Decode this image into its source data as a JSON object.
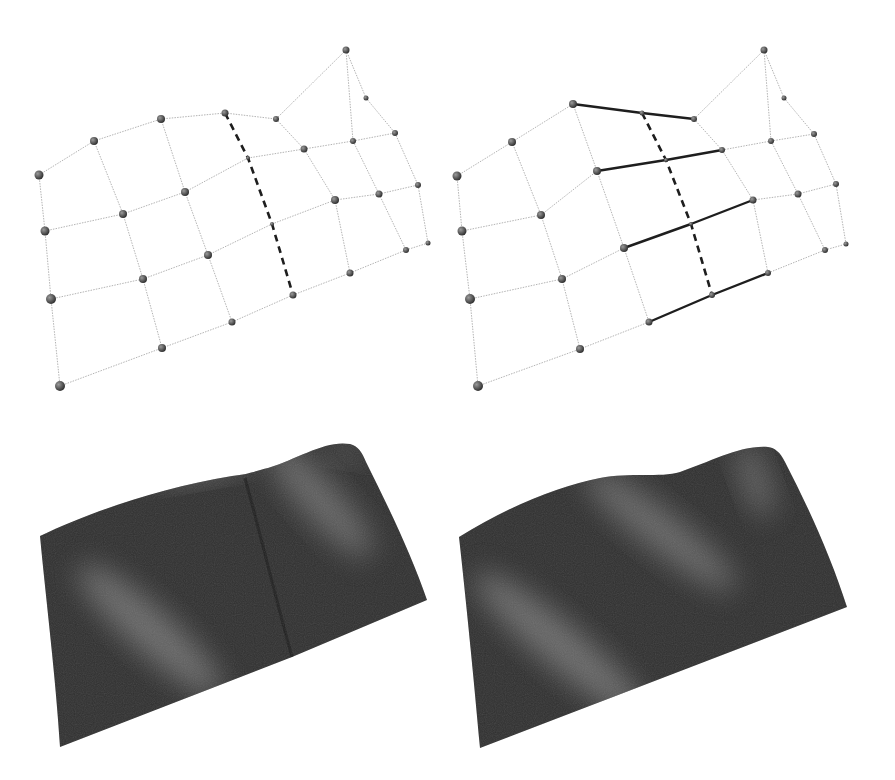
{
  "figure": {
    "colors": {
      "background": "#ffffff",
      "mesh_edge": "#b4b4b4",
      "highlight_edge": "#1e1e1e",
      "vertex": "#4a4a4a",
      "surface_dark": "#2e2e2e",
      "surface_light": "#9a9a9a"
    },
    "panels": [
      {
        "id": "control-mesh-left",
        "kind": "control-mesh",
        "vertices": [
          [
            39,
            175
          ],
          [
            94,
            141
          ],
          [
            161,
            119
          ],
          [
            225,
            113
          ],
          [
            276,
            119
          ],
          [
            346,
            50
          ],
          [
            366,
            98
          ],
          [
            395,
            133
          ],
          [
            248,
            158
          ],
          [
            304,
            149
          ],
          [
            353,
            141
          ],
          [
            45,
            231
          ],
          [
            123,
            214
          ],
          [
            185,
            192
          ],
          [
            272,
            224
          ],
          [
            335,
            200
          ],
          [
            379,
            194
          ],
          [
            418,
            185
          ],
          [
            51,
            299
          ],
          [
            143,
            279
          ],
          [
            208,
            255
          ],
          [
            293,
            295
          ],
          [
            350,
            273
          ],
          [
            406,
            250
          ],
          [
            428,
            243
          ],
          [
            60,
            386
          ],
          [
            162,
            348
          ],
          [
            232,
            322
          ]
        ],
        "vertex_radius": [
          4.5,
          4,
          4,
          3.5,
          3,
          3.5,
          2.5,
          3,
          2,
          3.5,
          3,
          4.5,
          4,
          4,
          2,
          4,
          3.5,
          3,
          5,
          4,
          4,
          3.5,
          3.5,
          3,
          2.5,
          5,
          4,
          3.5
        ],
        "edges": [
          [
            0,
            1
          ],
          [
            1,
            2
          ],
          [
            2,
            3
          ],
          [
            3,
            4
          ],
          [
            4,
            5
          ],
          [
            5,
            6
          ],
          [
            6,
            7
          ],
          [
            5,
            10
          ],
          [
            8,
            9
          ],
          [
            9,
            10
          ],
          [
            10,
            7
          ],
          [
            11,
            12
          ],
          [
            12,
            13
          ],
          [
            13,
            8
          ],
          [
            14,
            15
          ],
          [
            15,
            16
          ],
          [
            16,
            17
          ],
          [
            18,
            19
          ],
          [
            19,
            20
          ],
          [
            20,
            14
          ],
          [
            21,
            22
          ],
          [
            22,
            23
          ],
          [
            23,
            24
          ],
          [
            25,
            26
          ],
          [
            26,
            27
          ],
          [
            27,
            21
          ],
          [
            0,
            11
          ],
          [
            11,
            18
          ],
          [
            18,
            25
          ],
          [
            1,
            12
          ],
          [
            12,
            19
          ],
          [
            19,
            26
          ],
          [
            2,
            13
          ],
          [
            13,
            20
          ],
          [
            20,
            27
          ],
          [
            4,
            9
          ],
          [
            9,
            15
          ],
          [
            15,
            22
          ],
          [
            10,
            16
          ],
          [
            16,
            23
          ],
          [
            7,
            17
          ],
          [
            17,
            24
          ]
        ],
        "bold_edges": [],
        "dashed_paths": [
          [
            [
              225,
              113
            ],
            [
              248,
              158
            ],
            [
              272,
              224
            ],
            [
              293,
              295
            ]
          ]
        ]
      },
      {
        "id": "control-mesh-right",
        "kind": "control-mesh",
        "vertices": [
          [
            457,
            176
          ],
          [
            512,
            142
          ],
          [
            573,
            104
          ],
          [
            642,
            113
          ],
          [
            694,
            119
          ],
          [
            764,
            50
          ],
          [
            784,
            98
          ],
          [
            814,
            134
          ],
          [
            597,
            171
          ],
          [
            666,
            160
          ],
          [
            722,
            150
          ],
          [
            771,
            141
          ],
          [
            462,
            231
          ],
          [
            541,
            215
          ],
          [
            624,
            248
          ],
          [
            691,
            224
          ],
          [
            753,
            200
          ],
          [
            798,
            194
          ],
          [
            836,
            184
          ],
          [
            470,
            299
          ],
          [
            562,
            279
          ],
          [
            649,
            322
          ],
          [
            712,
            295
          ],
          [
            768,
            273
          ],
          [
            825,
            250
          ],
          [
            846,
            244
          ],
          [
            478,
            386
          ],
          [
            580,
            349
          ]
        ],
        "vertex_radius": [
          4.5,
          4,
          4,
          2.5,
          3,
          3.5,
          2.5,
          3,
          4,
          2,
          3,
          3,
          4.5,
          4,
          4,
          2,
          3.5,
          3.5,
          3,
          5,
          4,
          3.5,
          3,
          3,
          3,
          2.5,
          5,
          4
        ],
        "edges": [
          [
            0,
            1
          ],
          [
            1,
            2
          ],
          [
            4,
            5
          ],
          [
            5,
            6
          ],
          [
            6,
            7
          ],
          [
            5,
            11
          ],
          [
            10,
            11
          ],
          [
            11,
            7
          ],
          [
            12,
            13
          ],
          [
            13,
            8
          ],
          [
            16,
            17
          ],
          [
            17,
            18
          ],
          [
            19,
            20
          ],
          [
            20,
            14
          ],
          [
            23,
            24
          ],
          [
            24,
            25
          ],
          [
            26,
            27
          ],
          [
            27,
            21
          ],
          [
            0,
            12
          ],
          [
            12,
            19
          ],
          [
            19,
            26
          ],
          [
            1,
            13
          ],
          [
            13,
            20
          ],
          [
            20,
            27
          ],
          [
            2,
            8
          ],
          [
            8,
            14
          ],
          [
            14,
            21
          ],
          [
            4,
            10
          ],
          [
            10,
            16
          ],
          [
            16,
            23
          ],
          [
            11,
            17
          ],
          [
            17,
            24
          ],
          [
            7,
            18
          ],
          [
            18,
            25
          ]
        ],
        "bold_edges": [
          [
            2,
            3
          ],
          [
            3,
            4
          ],
          [
            8,
            9
          ],
          [
            9,
            10
          ],
          [
            14,
            15
          ],
          [
            15,
            16
          ],
          [
            21,
            22
          ],
          [
            22,
            23
          ]
        ],
        "dashed_paths": [
          [
            [
              642,
              113
            ],
            [
              666,
              160
            ],
            [
              691,
              224
            ],
            [
              712,
              295
            ]
          ]
        ]
      }
    ],
    "surfaces": [
      {
        "id": "surface-left",
        "kind": "rendered-surface",
        "has_crease": true,
        "outline": "M40,536 C90,512 160,488 232,476 C250,474 258,470 268,468 C300,458 325,440 350,444 C358,446 362,452 366,462 C390,510 412,556 427,600 L292,657 L60,747 C56,680 46,600 40,536 Z",
        "crease": "M245,478 C262,540 276,600 292,657",
        "highlights": [
          {
            "cx": 150,
            "cy": 630,
            "rx": 95,
            "ry": 22,
            "rot": 42,
            "opacity": 0.55
          },
          {
            "cx": 200,
            "cy": 468,
            "rx": 55,
            "ry": 12,
            "rot": -10,
            "opacity": 0.45
          },
          {
            "cx": 320,
            "cy": 500,
            "rx": 75,
            "ry": 20,
            "rot": 48,
            "opacity": 0.5
          },
          {
            "cx": 345,
            "cy": 455,
            "rx": 20,
            "ry": 8,
            "rot": 10,
            "opacity": 0.35
          }
        ]
      },
      {
        "id": "surface-right",
        "kind": "rendered-surface",
        "has_crease": false,
        "outline": "M459,537 C510,505 560,486 600,478 C630,472 660,478 680,472 C710,462 740,445 768,447 C775,448 780,452 785,462 C810,510 832,560 847,607 L480,748 C474,680 466,600 459,537 Z",
        "crease": "",
        "highlights": [
          {
            "cx": 560,
            "cy": 645,
            "rx": 110,
            "ry": 22,
            "rot": 40,
            "opacity": 0.55
          },
          {
            "cx": 660,
            "cy": 530,
            "rx": 95,
            "ry": 20,
            "rot": 38,
            "opacity": 0.5
          },
          {
            "cx": 755,
            "cy": 480,
            "rx": 40,
            "ry": 14,
            "rot": 70,
            "opacity": 0.45
          }
        ]
      }
    ]
  }
}
